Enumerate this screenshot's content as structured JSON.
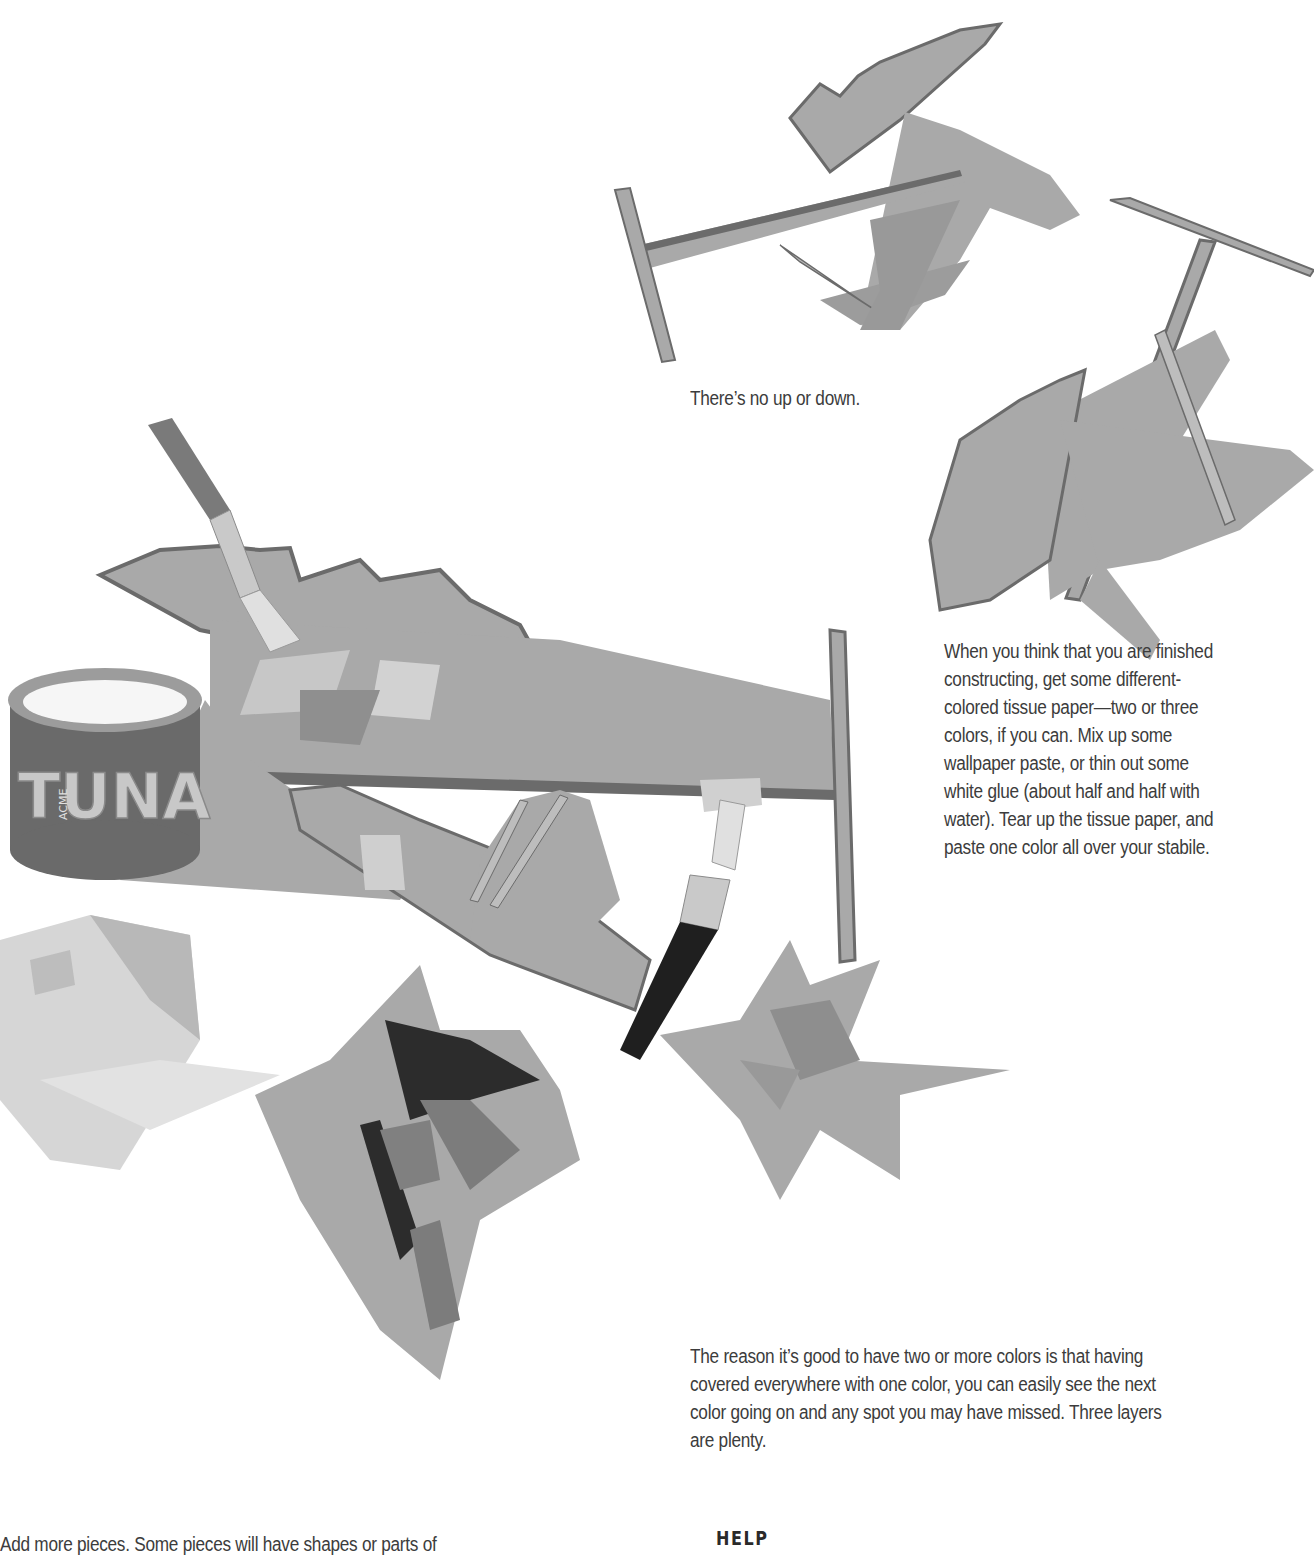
{
  "page": {
    "background": "#ffffff",
    "text_color": "#3c3c3c"
  },
  "illustration": {
    "description": "Cardboard stabile sculptures being covered with tissue paper and paste",
    "objects": [
      {
        "name": "stabile-top",
        "label": "cardboard stabile"
      },
      {
        "name": "stabile-right",
        "label": "cardboard stabile"
      },
      {
        "name": "stabile-main",
        "label": "cardboard stabile with tissue paper"
      },
      {
        "name": "tuna-can",
        "label": "ACME TUNA can of paste"
      },
      {
        "name": "paintbrush-left",
        "label": "paste brush"
      },
      {
        "name": "paintbrush-right",
        "label": "paste brush"
      },
      {
        "name": "tissue-pile-light",
        "label": "light tissue paper scraps"
      },
      {
        "name": "tissue-pile-dark",
        "label": "dark tissue paper scraps"
      },
      {
        "name": "tissue-pile-right",
        "label": "tissue paper scraps"
      }
    ],
    "can_label": "TUNA",
    "can_brand": "ACME",
    "colors": {
      "cardboard_fill": "#a9a9a9",
      "cardboard_edge": "#6b6b6b",
      "cardboard_light": "#bdbdbd",
      "tissue_dark": "#2c2c2c",
      "tissue_mid": "#8a8a8a",
      "tissue_light": "#d6d6d6",
      "brush_handle": "#7a7a7a",
      "brush_dark": "#1f1f1f",
      "ferrule": "#c9c9c9"
    }
  },
  "text": {
    "caption_top": "There’s no up or down.",
    "para_right": [
      "When you think that you are finished",
      "constructing, get some different-",
      "colored tissue paper—two or three",
      "colors, if you can. Mix up some",
      "wallpaper paste, or thin out some",
      "white glue (about half and half with",
      "water). Tear up the tissue paper, and",
      "paste one color all over your stabile."
    ],
    "para_bottom": [
      "The reason it’s good to have two or more colors is that having",
      "covered everywhere with one color, you can easily see the next",
      "color going on and any spot you may have missed. Three layers",
      "are plenty."
    ],
    "para_left_partial": "Add more pieces. Some pieces will have shapes or parts of",
    "help_heading": "HELP"
  }
}
